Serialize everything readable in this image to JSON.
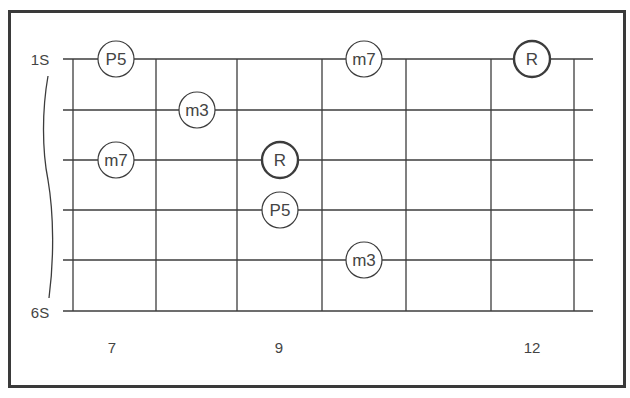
{
  "diagram": {
    "type": "guitar-fretboard",
    "string_labels": {
      "top": "1S",
      "bottom": "6S"
    },
    "fret_labels": [
      {
        "text": "7",
        "x": 112
      },
      {
        "text": "9",
        "x": 279
      },
      {
        "text": "12",
        "x": 532
      }
    ],
    "strings_y": [
      59,
      110,
      160,
      210,
      260,
      311
    ],
    "frets_x": [
      73,
      156,
      237,
      322,
      406,
      491,
      574
    ],
    "string_x_start": 63,
    "string_x_end": 593,
    "notes": [
      {
        "label": "P5",
        "string": 1,
        "x": 116,
        "root": false
      },
      {
        "label": "m7",
        "string": 1,
        "x": 364,
        "root": false
      },
      {
        "label": "R",
        "string": 1,
        "x": 532,
        "root": true
      },
      {
        "label": "m3",
        "string": 2,
        "x": 197,
        "root": false
      },
      {
        "label": "m7",
        "string": 3,
        "x": 116,
        "root": false
      },
      {
        "label": "R",
        "string": 3,
        "x": 280,
        "root": true
      },
      {
        "label": "P5",
        "string": 4,
        "x": 280,
        "root": false
      },
      {
        "label": "m3",
        "string": 5,
        "x": 364,
        "root": false
      }
    ],
    "colors": {
      "line": "#3c3c3c",
      "frame": "#3a3a3a",
      "text": "#444444"
    }
  }
}
